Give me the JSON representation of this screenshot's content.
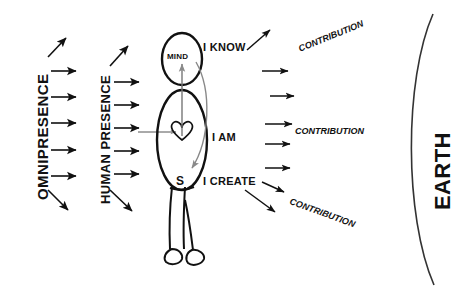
{
  "diagram": {
    "background_color": "#ffffff",
    "ink_color": "#111111",
    "accent_gray": "#8a8a8a"
  },
  "left_flow": {
    "omnipresence_label": "OMNIPRESENCE",
    "human_presence_label": "HUMAN PRESENCE"
  },
  "figure": {
    "mind_label": "MIND",
    "soul_label": "S",
    "statements": {
      "know": "I KNOW",
      "am": "I AM",
      "create": "I CREATE"
    }
  },
  "right_flow": {
    "contribution_top": "CONTRIBUTION",
    "contribution_middle": "CONTRIBUTION",
    "contribution_bottom": "CONTRIBUTION",
    "earth_label": "EARTH"
  }
}
